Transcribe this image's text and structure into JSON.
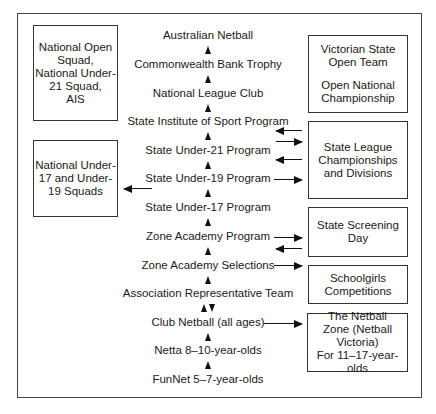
{
  "diagram": {
    "pathway": [
      "Australian Netball",
      "Commonwealth Bank Trophy",
      "National League Club",
      "State Institute of Sport Program",
      "State Under-21 Program",
      "State Under-19 Program",
      "State Under-17 Program",
      "Zone Academy Program",
      "Zone Academy Selections",
      "Association Representative Team",
      "Club Netball (all ages)",
      "Netta 8–10-year-olds",
      "FunNet 5–7-year-olds"
    ],
    "left_boxes": [
      {
        "lines": [
          "National Open",
          "Squad,",
          "National Under-",
          "21 Squad,",
          "AIS"
        ]
      },
      {
        "lines": [
          "National Under-",
          "17 and Under-",
          "19 Squads"
        ]
      }
    ],
    "right_boxes": [
      {
        "lines": [
          "Victorian State",
          "Open Team"
        ],
        "lines2": [
          "Open National",
          "Championship"
        ]
      },
      {
        "lines": [
          "State League",
          "Championships",
          "and Divisions"
        ]
      },
      {
        "lines": [
          "State Screening",
          "Day"
        ]
      },
      {
        "lines": [
          "Schoolgirls",
          "Competitions"
        ]
      },
      {
        "lines": [
          "The Netball",
          "Zone (Netball",
          "Victoria)",
          "For 11–17-year-olds"
        ]
      }
    ],
    "connections": [
      {
        "from": "State League Championships and Divisions",
        "to": "State Institute of Sport Program"
      },
      {
        "from": "State Institute of Sport Program",
        "to": "State League Championships and Divisions"
      },
      {
        "from": "State League Championships and Divisions",
        "to": "State Under-21 Program"
      },
      {
        "from": "State Under-19 Program",
        "to": "State League Championships and Divisions"
      },
      {
        "from": "State Under-19 Program",
        "to": "National Under-17 and Under-19 Squads"
      },
      {
        "from": "Zone Academy Program",
        "to": "State Screening Day"
      },
      {
        "from": "State Screening Day",
        "to": "Zone Academy Program"
      },
      {
        "from": "Zone Academy Selections",
        "to": "Schoolgirls Competitions"
      },
      {
        "from": "Club Netball (all ages)",
        "to": "The Netball Zone (Netball Victoria)"
      },
      {
        "from": "Association Representative Team",
        "to": "Club Netball (all ages)",
        "bidirectional": true
      }
    ]
  }
}
